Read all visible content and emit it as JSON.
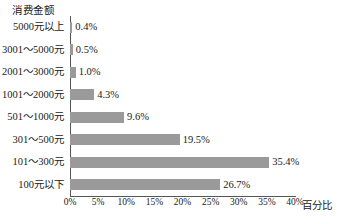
{
  "chart_data": {
    "type": "bar",
    "orientation": "horizontal",
    "title": "",
    "ylabel": "消费金额",
    "xlabel": "百分比",
    "categories": [
      "5000元以上",
      "3001～5000元",
      "2001～3000元",
      "1001～2000元",
      "501～1000元",
      "301～500元",
      "101～300元",
      "100元以下"
    ],
    "values": [
      0.4,
      0.5,
      1.0,
      4.3,
      9.6,
      19.5,
      35.4,
      26.7
    ],
    "value_labels": [
      "0.4%",
      "0.5%",
      "1.0%",
      "4.3%",
      "9.6%",
      "19.5%",
      "35.4%",
      "26.7%"
    ],
    "xlim": [
      0,
      40
    ],
    "xticks": [
      0,
      5,
      10,
      15,
      20,
      25,
      30,
      35,
      40
    ],
    "xtick_labels": [
      "0%",
      "5%",
      "10%",
      "15%",
      "20%",
      "25%",
      "30%",
      "35%",
      "40%"
    ],
    "grid": false,
    "legend": false,
    "bar_color": "#9a9a9a",
    "axis_color": "#555555"
  }
}
